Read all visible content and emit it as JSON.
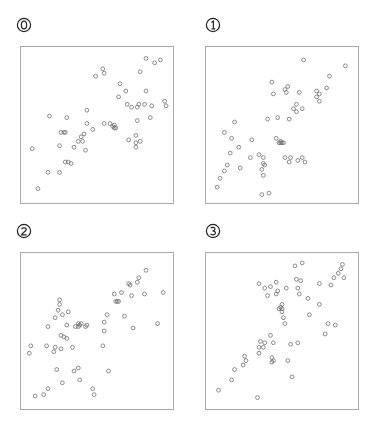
{
  "chart_data": [
    {
      "type": "scatter",
      "label": "0",
      "title": "",
      "xlabel": "",
      "ylabel": "",
      "grid": false,
      "xlim": [
        0,
        1
      ],
      "ylim": [
        0,
        1
      ],
      "points": [
        [
          0.05,
          0.34
        ],
        [
          0.09,
          0.07
        ],
        [
          0.16,
          0.18
        ],
        [
          0.17,
          0.56
        ],
        [
          0.24,
          0.18
        ],
        [
          0.24,
          0.36
        ],
        [
          0.25,
          0.45
        ],
        [
          0.27,
          0.45
        ],
        [
          0.28,
          0.45
        ],
        [
          0.28,
          0.25
        ],
        [
          0.3,
          0.25
        ],
        [
          0.32,
          0.24
        ],
        [
          0.29,
          0.55
        ],
        [
          0.34,
          0.35
        ],
        [
          0.37,
          0.39
        ],
        [
          0.39,
          0.42
        ],
        [
          0.4,
          0.39
        ],
        [
          0.41,
          0.44
        ],
        [
          0.42,
          0.33
        ],
        [
          0.43,
          0.51
        ],
        [
          0.43,
          0.6
        ],
        [
          0.47,
          0.47
        ],
        [
          0.49,
          0.83
        ],
        [
          0.54,
          0.88
        ],
        [
          0.55,
          0.85
        ],
        [
          0.55,
          0.51
        ],
        [
          0.59,
          0.51
        ],
        [
          0.61,
          0.49
        ],
        [
          0.62,
          0.5
        ],
        [
          0.62,
          0.48
        ],
        [
          0.63,
          0.48
        ],
        [
          0.66,
          0.78
        ],
        [
          0.65,
          0.69
        ],
        [
          0.7,
          0.73
        ],
        [
          0.71,
          0.64
        ],
        [
          0.72,
          0.4
        ],
        [
          0.74,
          0.62
        ],
        [
          0.77,
          0.38
        ],
        [
          0.77,
          0.43
        ],
        [
          0.77,
          0.35
        ],
        [
          0.78,
          0.53
        ],
        [
          0.79,
          0.64
        ],
        [
          0.78,
          0.62
        ],
        [
          0.8,
          0.86
        ],
        [
          0.8,
          0.39
        ],
        [
          0.83,
          0.64
        ],
        [
          0.84,
          0.73
        ],
        [
          0.84,
          0.95
        ],
        [
          0.87,
          0.55
        ],
        [
          0.88,
          0.63
        ],
        [
          0.9,
          0.92
        ],
        [
          0.94,
          0.94
        ],
        [
          0.97,
          0.66
        ],
        [
          0.98,
          0.63
        ]
      ]
    },
    {
      "type": "scatter",
      "label": "1",
      "title": "",
      "xlabel": "",
      "ylabel": "",
      "grid": false,
      "xlim": [
        0,
        1
      ],
      "ylim": [
        0,
        1
      ],
      "points": [
        [
          0.05,
          0.08
        ],
        [
          0.07,
          0.14
        ],
        [
          0.1,
          0.19
        ],
        [
          0.12,
          0.23
        ],
        [
          0.1,
          0.45
        ],
        [
          0.15,
          0.41
        ],
        [
          0.17,
          0.52
        ],
        [
          0.14,
          0.31
        ],
        [
          0.21,
          0.21
        ],
        [
          0.2,
          0.35
        ],
        [
          0.28,
          0.28
        ],
        [
          0.29,
          0.4
        ],
        [
          0.36,
          0.03
        ],
        [
          0.34,
          0.3
        ],
        [
          0.37,
          0.24
        ],
        [
          0.37,
          0.28
        ],
        [
          0.36,
          0.2
        ],
        [
          0.38,
          0.23
        ],
        [
          0.37,
          0.16
        ],
        [
          0.41,
          0.04
        ],
        [
          0.4,
          0.54
        ],
        [
          0.43,
          0.79
        ],
        [
          0.44,
          0.71
        ],
        [
          0.46,
          0.41
        ],
        [
          0.47,
          0.55
        ],
        [
          0.48,
          0.38
        ],
        [
          0.49,
          0.39
        ],
        [
          0.49,
          0.38
        ],
        [
          0.5,
          0.38
        ],
        [
          0.51,
          0.38
        ],
        [
          0.52,
          0.28
        ],
        [
          0.52,
          0.74
        ],
        [
          0.53,
          0.72
        ],
        [
          0.54,
          0.76
        ],
        [
          0.55,
          0.54
        ],
        [
          0.55,
          0.25
        ],
        [
          0.56,
          0.28
        ],
        [
          0.58,
          0.61
        ],
        [
          0.6,
          0.64
        ],
        [
          0.6,
          0.59
        ],
        [
          0.61,
          0.26
        ],
        [
          0.62,
          0.72
        ],
        [
          0.64,
          0.61
        ],
        [
          0.64,
          0.28
        ],
        [
          0.66,
          0.25
        ],
        [
          0.65,
          0.94
        ],
        [
          0.74,
          0.69
        ],
        [
          0.74,
          0.73
        ],
        [
          0.76,
          0.66
        ],
        [
          0.76,
          0.71
        ],
        [
          0.81,
          0.75
        ],
        [
          0.83,
          0.83
        ],
        [
          0.94,
          0.9
        ]
      ]
    },
    {
      "type": "scatter",
      "label": "2",
      "title": "",
      "xlabel": "",
      "ylabel": "",
      "grid": false,
      "xlim": [
        0,
        1
      ],
      "ylim": [
        0,
        1
      ],
      "points": [
        [
          0.03,
          0.35
        ],
        [
          0.04,
          0.4
        ],
        [
          0.07,
          0.06
        ],
        [
          0.13,
          0.07
        ],
        [
          0.16,
          0.11
        ],
        [
          0.15,
          0.4
        ],
        [
          0.16,
          0.53
        ],
        [
          0.2,
          0.36
        ],
        [
          0.21,
          0.39
        ],
        [
          0.21,
          0.59
        ],
        [
          0.22,
          0.24
        ],
        [
          0.23,
          0.64
        ],
        [
          0.24,
          0.71
        ],
        [
          0.24,
          0.68
        ],
        [
          0.25,
          0.38
        ],
        [
          0.25,
          0.47
        ],
        [
          0.26,
          0.15
        ],
        [
          0.26,
          0.61
        ],
        [
          0.27,
          0.46
        ],
        [
          0.29,
          0.45
        ],
        [
          0.3,
          0.63
        ],
        [
          0.29,
          0.54
        ],
        [
          0.33,
          0.39
        ],
        [
          0.34,
          0.23
        ],
        [
          0.35,
          0.53
        ],
        [
          0.37,
          0.55
        ],
        [
          0.38,
          0.54
        ],
        [
          0.37,
          0.25
        ],
        [
          0.37,
          0.53
        ],
        [
          0.38,
          0.17
        ],
        [
          0.39,
          0.55
        ],
        [
          0.42,
          0.53
        ],
        [
          0.43,
          0.54
        ],
        [
          0.47,
          0.11
        ],
        [
          0.48,
          0.07
        ],
        [
          0.54,
          0.4
        ],
        [
          0.55,
          0.5
        ],
        [
          0.55,
          0.56
        ],
        [
          0.57,
          0.61
        ],
        [
          0.58,
          0.23
        ],
        [
          0.62,
          0.75
        ],
        [
          0.63,
          0.7
        ],
        [
          0.64,
          0.7
        ],
        [
          0.65,
          0.7
        ],
        [
          0.67,
          0.76
        ],
        [
          0.69,
          0.6
        ],
        [
          0.72,
          0.82
        ],
        [
          0.73,
          0.81
        ],
        [
          0.74,
          0.74
        ],
        [
          0.75,
          0.52
        ],
        [
          0.78,
          0.83
        ],
        [
          0.79,
          0.86
        ],
        [
          0.83,
          0.75
        ],
        [
          0.84,
          0.91
        ],
        [
          0.92,
          0.55
        ],
        [
          0.96,
          0.76
        ]
      ]
    },
    {
      "type": "scatter",
      "label": "3",
      "title": "",
      "xlabel": "",
      "ylabel": "",
      "grid": false,
      "xlim": [
        0,
        1
      ],
      "ylim": [
        0,
        1
      ],
      "points": [
        [
          0.06,
          0.1
        ],
        [
          0.15,
          0.17
        ],
        [
          0.17,
          0.24
        ],
        [
          0.23,
          0.27
        ],
        [
          0.24,
          0.33
        ],
        [
          0.25,
          0.3
        ],
        [
          0.33,
          0.05
        ],
        [
          0.34,
          0.39
        ],
        [
          0.34,
          0.35
        ],
        [
          0.35,
          0.43
        ],
        [
          0.37,
          0.39
        ],
        [
          0.38,
          0.42
        ],
        [
          0.34,
          0.82
        ],
        [
          0.38,
          0.79
        ],
        [
          0.42,
          0.8
        ],
        [
          0.4,
          0.74
        ],
        [
          0.42,
          0.47
        ],
        [
          0.43,
          0.29
        ],
        [
          0.43,
          0.32
        ],
        [
          0.44,
          0.3
        ],
        [
          0.44,
          0.42
        ],
        [
          0.46,
          0.83
        ],
        [
          0.46,
          0.75
        ],
        [
          0.47,
          0.77
        ],
        [
          0.48,
          0.65
        ],
        [
          0.49,
          0.66
        ],
        [
          0.5,
          0.65
        ],
        [
          0.5,
          0.63
        ],
        [
          0.5,
          0.68
        ],
        [
          0.51,
          0.59
        ],
        [
          0.52,
          0.55
        ],
        [
          0.53,
          0.79
        ],
        [
          0.54,
          0.3
        ],
        [
          0.56,
          0.41
        ],
        [
          0.57,
          0.19
        ],
        [
          0.59,
          0.94
        ],
        [
          0.6,
          0.85
        ],
        [
          0.61,
          0.79
        ],
        [
          0.62,
          0.75
        ],
        [
          0.61,
          0.42
        ],
        [
          0.63,
          0.84
        ],
        [
          0.64,
          0.96
        ],
        [
          0.68,
          0.72
        ],
        [
          0.69,
          0.61
        ],
        [
          0.76,
          0.68
        ],
        [
          0.76,
          0.82
        ],
        [
          0.8,
          0.48
        ],
        [
          0.82,
          0.55
        ],
        [
          0.84,
          0.81
        ],
        [
          0.86,
          0.86
        ],
        [
          0.87,
          0.54
        ],
        [
          0.89,
          0.89
        ],
        [
          0.91,
          0.92
        ],
        [
          0.92,
          0.95
        ],
        [
          0.93,
          0.86
        ]
      ]
    }
  ],
  "panels": [
    {
      "label": "0",
      "glyph": "⓪"
    },
    {
      "label": "1",
      "glyph": "①"
    },
    {
      "label": "2",
      "glyph": "②"
    },
    {
      "label": "3",
      "glyph": "③"
    }
  ],
  "style": {
    "marker_stroke": "#6e6e6e",
    "box_border": "#a8a8a8",
    "label_color": "#222222"
  }
}
